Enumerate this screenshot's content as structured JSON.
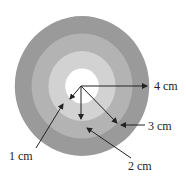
{
  "diagram": {
    "rings": [
      {
        "name": "ring-4",
        "radius_cm": 4,
        "color": "#9a9a9a"
      },
      {
        "name": "ring-3",
        "radius_cm": 3,
        "color": "#b3b3b3"
      },
      {
        "name": "ring-2",
        "radius_cm": 2,
        "color": "#d2d2d2"
      },
      {
        "name": "ring-1",
        "radius_cm": 1,
        "color": "#ffffff"
      }
    ],
    "labels": {
      "r1": "1 cm",
      "r2": "2 cm",
      "r3": "3 cm",
      "r4": "4 cm"
    },
    "arrow_color": "#222222"
  }
}
